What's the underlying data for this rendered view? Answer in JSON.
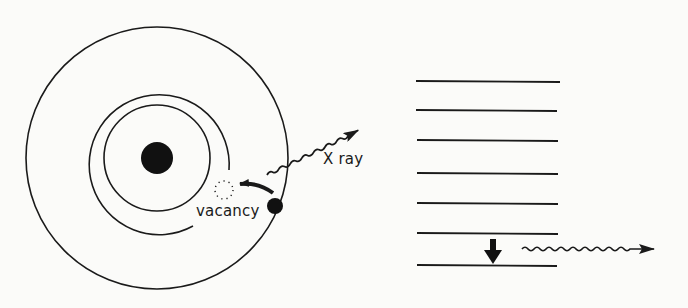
{
  "diagram": {
    "type": "atomic X-ray emission diagram",
    "colors": {
      "ink": "#1a1a1a",
      "background": "#fbfbf9"
    },
    "atom": {
      "center": [
        157,
        158
      ],
      "nucleus_radius": 16,
      "shells": [
        {
          "name": "inner-shell",
          "radius": 53,
          "complete": true
        },
        {
          "name": "middle-shell",
          "radius": 70,
          "complete": false,
          "gap": "lower-right"
        },
        {
          "name": "outer-shell",
          "radius": 131,
          "complete": true
        }
      ],
      "vacancy": {
        "center": [
          224,
          190
        ],
        "radius": 9,
        "style": "dotted"
      },
      "electron": {
        "center": [
          275,
          206
        ],
        "radius": 8
      }
    },
    "labels": {
      "vacancy": "vacancy",
      "xray": "X ray"
    },
    "energy_levels": {
      "count": 7,
      "x_start": 416,
      "x_end": 559,
      "y_positions": [
        81,
        110,
        140,
        173,
        203,
        233,
        266
      ]
    },
    "transition_arrow": {
      "x": 493,
      "from_y": 239,
      "to_y": 264
    },
    "emitted_photon": {
      "from": [
        522,
        250
      ],
      "to": [
        654,
        250
      ]
    }
  }
}
